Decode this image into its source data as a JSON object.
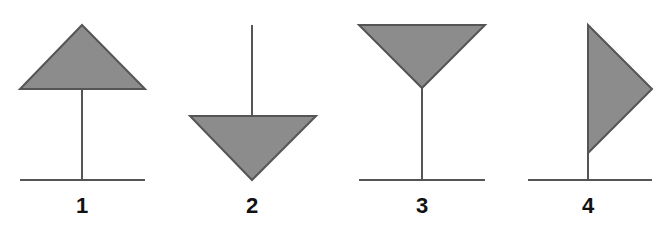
{
  "colors": {
    "fill": "#8c8c8c",
    "stroke": "#555555",
    "label": "#111111",
    "background": "#ffffff"
  },
  "figures": [
    {
      "label": "1",
      "icon": "flag-triangle-up-top-icon",
      "description": "Upward triangle on top of a stem above a ground line"
    },
    {
      "label": "2",
      "icon": "flag-triangle-down-bottom-icon",
      "description": "Downward triangle at the bottom of a hanging stem"
    },
    {
      "label": "3",
      "icon": "flag-triangle-down-top-icon",
      "description": "Downward (goblet) triangle on top of a stem above a ground line"
    },
    {
      "label": "4",
      "icon": "flag-pennant-right-icon",
      "description": "Pennant triangle pointing right attached to a pole above a ground line"
    }
  ]
}
